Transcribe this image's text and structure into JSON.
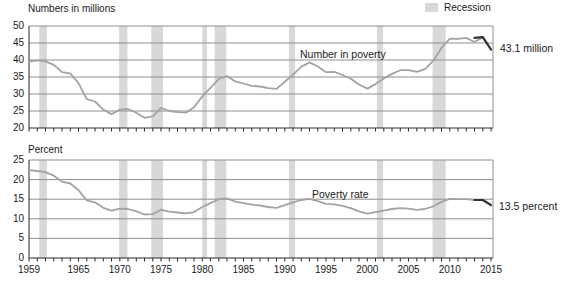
{
  "colors": {
    "background": "#ffffff",
    "text": "#1a1a1a",
    "recession_band": "#d8d8d8",
    "gridline": "#8f8f8f",
    "axis": "#2a2a2a",
    "series_line": "#a3a3a3",
    "highlight_line": "#333333"
  },
  "legend": {
    "label": "Recession",
    "position": "top-right"
  },
  "chart_data": [
    {
      "type": "line",
      "title": "Numbers in millions",
      "series_label": "Number in poverty",
      "end_annotation": "43.1 million",
      "ylim": [
        20,
        50
      ],
      "yticks": [
        20,
        25,
        30,
        35,
        40,
        45,
        50
      ],
      "grid": true,
      "years": [
        1959,
        1960,
        1961,
        1962,
        1963,
        1964,
        1965,
        1966,
        1967,
        1968,
        1969,
        1970,
        1971,
        1972,
        1973,
        1974,
        1975,
        1976,
        1977,
        1978,
        1979,
        1980,
        1981,
        1982,
        1983,
        1984,
        1985,
        1986,
        1987,
        1988,
        1989,
        1990,
        1991,
        1992,
        1993,
        1994,
        1995,
        1996,
        1997,
        1998,
        1999,
        2000,
        2001,
        2002,
        2003,
        2004,
        2005,
        2006,
        2007,
        2008,
        2009,
        2010,
        2011,
        2012,
        2013,
        2014,
        2015
      ],
      "values": [
        39.5,
        39.9,
        39.6,
        38.6,
        36.4,
        36.1,
        33.2,
        28.5,
        27.8,
        25.4,
        24.1,
        25.4,
        25.6,
        24.5,
        23.0,
        23.4,
        25.9,
        25.0,
        24.7,
        24.5,
        26.1,
        29.3,
        31.8,
        34.4,
        35.3,
        33.7,
        33.1,
        32.4,
        32.2,
        31.7,
        31.5,
        33.6,
        35.7,
        38.0,
        39.3,
        38.1,
        36.4,
        36.5,
        35.6,
        34.5,
        32.8,
        31.6,
        32.9,
        34.6,
        35.9,
        37.0,
        37.0,
        36.5,
        37.3,
        39.8,
        43.6,
        46.3,
        46.2,
        46.5,
        45.3,
        46.7,
        43.1
      ],
      "highlight_segment": {
        "years": [
          2013,
          2014,
          2015
        ],
        "values": [
          46.5,
          46.7,
          43.1
        ]
      },
      "x_tick_labels": [],
      "recession_spans": [
        [
          1960.25,
          1961.17
        ],
        [
          1969.92,
          1970.92
        ],
        [
          1973.83,
          1975.25
        ],
        [
          1980.0,
          1980.58
        ],
        [
          1981.5,
          1982.92
        ],
        [
          1990.5,
          1991.25
        ],
        [
          2001.17,
          2001.92
        ],
        [
          2007.92,
          2009.5
        ]
      ]
    },
    {
      "type": "line",
      "title": "Percent",
      "series_label": "Poverty rate",
      "end_annotation": "13.5 percent",
      "ylim": [
        0,
        25
      ],
      "yticks": [
        0,
        5,
        10,
        15,
        20,
        25
      ],
      "grid": true,
      "years": [
        1959,
        1960,
        1961,
        1962,
        1963,
        1964,
        1965,
        1966,
        1967,
        1968,
        1969,
        1970,
        1971,
        1972,
        1973,
        1974,
        1975,
        1976,
        1977,
        1978,
        1979,
        1980,
        1981,
        1982,
        1983,
        1984,
        1985,
        1986,
        1987,
        1988,
        1989,
        1990,
        1991,
        1992,
        1993,
        1994,
        1995,
        1996,
        1997,
        1998,
        1999,
        2000,
        2001,
        2002,
        2003,
        2004,
        2005,
        2006,
        2007,
        2008,
        2009,
        2010,
        2011,
        2012,
        2013,
        2014,
        2015
      ],
      "values": [
        22.4,
        22.2,
        21.9,
        21.0,
        19.5,
        19.0,
        17.3,
        14.7,
        14.2,
        12.8,
        12.1,
        12.6,
        12.5,
        11.9,
        11.1,
        11.2,
        12.3,
        11.8,
        11.6,
        11.4,
        11.7,
        13.0,
        14.0,
        15.0,
        15.2,
        14.4,
        14.0,
        13.6,
        13.4,
        13.0,
        12.8,
        13.5,
        14.2,
        14.8,
        15.1,
        14.5,
        13.8,
        13.7,
        13.3,
        12.7,
        11.9,
        11.3,
        11.7,
        12.1,
        12.5,
        12.7,
        12.6,
        12.3,
        12.5,
        13.2,
        14.3,
        15.1,
        15.0,
        15.0,
        14.8,
        14.8,
        13.5
      ],
      "highlight_segment": {
        "years": [
          2013,
          2014,
          2015
        ],
        "values": [
          14.8,
          14.8,
          13.5
        ]
      },
      "x_tick_labels": [
        1959,
        1965,
        1970,
        1975,
        1980,
        1985,
        1990,
        1995,
        2000,
        2005,
        2010,
        2015
      ],
      "recession_spans": [
        [
          1960.25,
          1961.17
        ],
        [
          1969.92,
          1970.92
        ],
        [
          1973.83,
          1975.25
        ],
        [
          1980.0,
          1980.58
        ],
        [
          1981.5,
          1982.92
        ],
        [
          1990.5,
          1991.25
        ],
        [
          2001.17,
          2001.92
        ],
        [
          2007.92,
          2009.5
        ]
      ]
    }
  ]
}
